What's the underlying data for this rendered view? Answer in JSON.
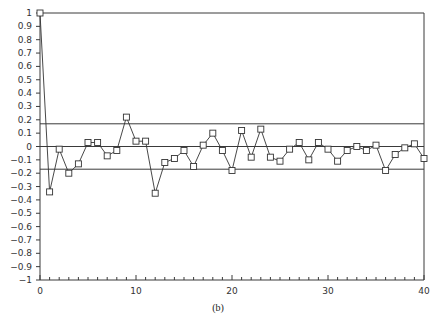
{
  "chart_data": {
    "type": "line",
    "title": "",
    "caption": "(b)",
    "xlabel": "",
    "ylabel": "",
    "xlim": [
      0,
      40
    ],
    "ylim": [
      -1,
      1
    ],
    "x_ticks": [
      0,
      10,
      20,
      30,
      40
    ],
    "x_minor_step": 1,
    "y_ticks": [
      1,
      0.9,
      0.8,
      0.7,
      0.6,
      0.5,
      0.4,
      0.3,
      0.2,
      0.1,
      0,
      -0.1,
      -0.2,
      -0.3,
      -0.4,
      -0.5,
      -0.6,
      -0.7,
      -0.8,
      -0.9,
      -1
    ],
    "y_tick_labels": [
      "1",
      "0.9",
      "0.8",
      "0.7",
      "0.6",
      "0.5",
      "0.4",
      "0.3",
      "0.2",
      "0.1",
      "0",
      "−0.1",
      "−0.2",
      "−0.3",
      "−0.4",
      "−0.5",
      "−0.6",
      "−0.7",
      "−0.8",
      "−0.9",
      "−1"
    ],
    "x_tick_labels": [
      "0",
      "10",
      "20",
      "30",
      "40"
    ],
    "grid": false,
    "legend": null,
    "marker": "square",
    "reference_lines": [
      {
        "name": "upper-confidence-bound",
        "y": 0.17
      },
      {
        "name": "zero-line",
        "y": 0
      },
      {
        "name": "lower-confidence-bound",
        "y": -0.17
      },
      {
        "name": "top-line",
        "y": 1
      }
    ],
    "series": [
      {
        "name": "autocorrelation",
        "x": [
          0,
          1,
          2,
          3,
          4,
          5,
          6,
          7,
          8,
          9,
          10,
          11,
          12,
          13,
          14,
          15,
          16,
          17,
          18,
          19,
          20,
          21,
          22,
          23,
          24,
          25,
          26,
          27,
          28,
          29,
          30,
          31,
          32,
          33,
          34,
          35,
          36,
          37,
          38,
          39,
          40
        ],
        "values": [
          1.0,
          -0.34,
          -0.02,
          -0.2,
          -0.13,
          0.03,
          0.03,
          -0.07,
          -0.03,
          0.22,
          0.04,
          0.04,
          -0.35,
          -0.12,
          -0.09,
          -0.03,
          -0.15,
          0.01,
          0.1,
          -0.03,
          -0.18,
          0.12,
          -0.08,
          0.13,
          -0.08,
          -0.11,
          -0.02,
          0.03,
          -0.1,
          0.03,
          -0.02,
          -0.11,
          -0.03,
          0.0,
          -0.03,
          0.01,
          -0.18,
          -0.06,
          -0.01,
          0.02,
          -0.09
        ]
      }
    ]
  }
}
